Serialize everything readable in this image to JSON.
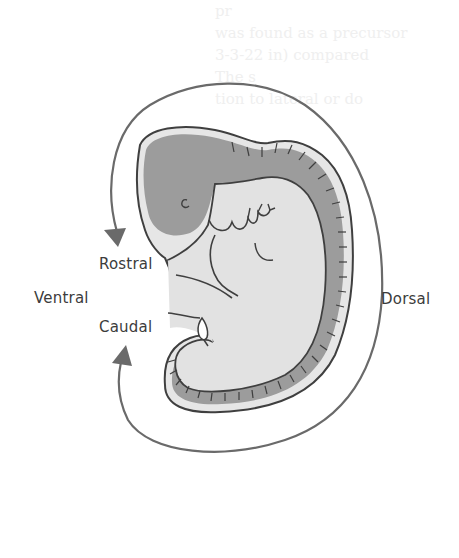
{
  "figure": {
    "labels": {
      "rostral": "Rostral",
      "caudal": "Caudal",
      "ventral": "Ventral",
      "dorsal": "Dorsal"
    },
    "colors": {
      "background": "#ffffff",
      "outline": "#3f3f3f",
      "arrow": "#6a6a6a",
      "neural_tube_fill": "#9c9c9c",
      "body_fill": "#e2e2e2",
      "rim_fill": "#e6e6e6",
      "label_text": "#3c3c3c"
    },
    "arrow": {
      "start": "rostral",
      "end": "caudal",
      "path_around": "dorsal",
      "start_head_direction": "down",
      "end_head_direction": "up"
    },
    "bleed_through_text": {
      "upper": [
        "pr",
        "was found as a precursor",
        "3-3-22 in) compared",
        "The s",
        "tion to lateral or do"
      ]
    }
  }
}
